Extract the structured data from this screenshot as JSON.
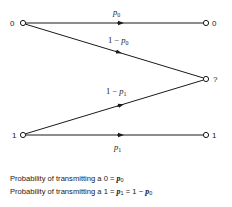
{
  "diagram": {
    "type": "binary erasure channel",
    "inputs": [
      {
        "id": "in0",
        "label": "0",
        "x": 23,
        "y": 23
      },
      {
        "id": "in1",
        "label": "1",
        "x": 23,
        "y": 135
      }
    ],
    "outputs": [
      {
        "id": "out0",
        "label": "0",
        "x": 206,
        "y": 23
      },
      {
        "id": "outq",
        "label": "?",
        "x": 206,
        "y": 79
      },
      {
        "id": "out1",
        "label": "1",
        "x": 206,
        "y": 135
      }
    ],
    "edges": [
      {
        "from": "in0",
        "to": "out0",
        "label_prefix": "",
        "label_var": "p",
        "label_sub": "0"
      },
      {
        "from": "in0",
        "to": "outq",
        "label_prefix": "1 − ",
        "label_var": "p",
        "label_sub": "0"
      },
      {
        "from": "in1",
        "to": "outq",
        "label_prefix": "1 − ",
        "label_var": "p",
        "label_sub": "1"
      },
      {
        "from": "in1",
        "to": "out1",
        "label_prefix": "",
        "label_var": "p",
        "label_sub": "1"
      }
    ],
    "colors": {
      "line": "#1a1a1a",
      "background": "#ffffff"
    }
  },
  "caption": {
    "line1": {
      "text": "Probability of transmitting a 0 = ",
      "var": "p",
      "sub": "0"
    },
    "line2": {
      "text": "Probability of transmitting a 1 = ",
      "var1": "p",
      "sub1": "1",
      "mid": " = 1 − ",
      "var2": "p",
      "sub2": "0"
    }
  }
}
